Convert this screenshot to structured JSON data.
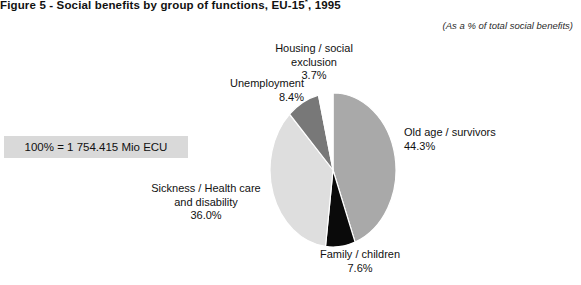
{
  "figure": {
    "title_main": "Figure 5 - Social benefits by group of functions, EU-15",
    "title_superscript": "*",
    "title_tail": ", 1995",
    "subtitle": "(As a % of total social benefits)",
    "total_note": "100% = 1 754.415 Mio ECU"
  },
  "chart_data": {
    "type": "pie",
    "title": "Figure 5 - Social benefits by group of functions, EU-15*, 1995",
    "subtitle": "(As a % of total social benefits)",
    "unit_note": "100% = 1 754.415 Mio ECU",
    "total_value": 1754.415,
    "total_unit": "Mio ECU",
    "value_suffix": "%",
    "start_angle_deg": 0,
    "direction": "clockwise",
    "legend": "none-labels-outside",
    "grid": false,
    "categories": [
      "Old age / survivors",
      "Family / children",
      "Sickness / Health care and disability",
      "Unemployment",
      "Housing / social exclusion"
    ],
    "values": [
      44.3,
      7.6,
      36.0,
      8.4,
      3.7
    ],
    "colors": [
      "#a9a9a9",
      "#0a0a0a",
      "#dedede",
      "#787878",
      "#ffffff"
    ],
    "slices": [
      {
        "label": "Old age / survivors",
        "value": 44.3,
        "display": "44.3%",
        "color": "#a9a9a9"
      },
      {
        "label": "Family / children",
        "value": 7.6,
        "display": "7.6%",
        "color": "#0a0a0a"
      },
      {
        "label": "Sickness / Health care and disability",
        "value": 36.0,
        "display": "36.0%",
        "color": "#dedede"
      },
      {
        "label": "Unemployment",
        "value": 8.4,
        "display": "8.4%",
        "color": "#787878"
      },
      {
        "label": "Housing / social exclusion",
        "value": 3.7,
        "display": "3.7%",
        "color": "#ffffff"
      }
    ]
  },
  "labels": {
    "old_age": {
      "name": "Old age / survivors",
      "pct": "44.3%"
    },
    "family": {
      "name": "Family / children",
      "pct": "7.6%"
    },
    "sickness": {
      "name_line1": "Sickness / Health care",
      "name_line2": "and disability",
      "pct": "36.0%"
    },
    "unemployment": {
      "name": "Unemployment",
      "pct": "8.4%"
    },
    "housing": {
      "name_line1": "Housing / social",
      "name_line2": "exclusion",
      "pct": "3.7%"
    }
  }
}
